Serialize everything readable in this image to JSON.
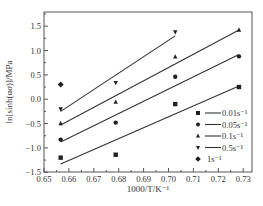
{
  "chart_data": {
    "type": "scatter",
    "title": "",
    "xlabel": "1000/T/K⁻¹",
    "ylabel": "ln[sinh(ασ)]/MPa",
    "xlim": [
      0.65,
      0.735
    ],
    "ylim": [
      -1.5,
      1.75
    ],
    "x_ticks": [
      0.65,
      0.66,
      0.67,
      0.68,
      0.69,
      0.7,
      0.71,
      0.72,
      0.73
    ],
    "x_tick_labels": [
      "0.65",
      "0.66",
      "0.67",
      "0.68",
      "0.69",
      "0.70",
      "0.71",
      "0.72",
      "0.73"
    ],
    "y_ticks": [
      -1.5,
      -1.0,
      -0.5,
      0.0,
      0.5,
      1.0,
      1.5
    ],
    "y_tick_labels": [
      "−1.5",
      "−1.0",
      "−0.5",
      "0.0",
      "0.5",
      "1.0",
      "1.5"
    ],
    "grid": false,
    "legend_position": "lower right",
    "series": [
      {
        "name": "0.01s⁻¹",
        "marker": "square",
        "x": [
          0.6567,
          0.6788,
          0.7027,
          0.7283
        ],
        "y": [
          -1.2,
          -1.14,
          -0.1,
          0.25
        ],
        "fit_line": {
          "x": [
            0.6567,
            0.7283
          ],
          "y": [
            -1.33,
            0.27
          ]
        }
      },
      {
        "name": "0.05s⁻¹",
        "marker": "circle",
        "x": [
          0.6567,
          0.6788,
          0.7027,
          0.7283
        ],
        "y": [
          -0.83,
          -0.48,
          0.46,
          0.88
        ],
        "fit_line": {
          "x": [
            0.6567,
            0.7283
          ],
          "y": [
            -0.88,
            0.92
          ]
        }
      },
      {
        "name": "0.1s⁻¹",
        "marker": "triangle-up",
        "x": [
          0.6567,
          0.6788,
          0.7027,
          0.7283
        ],
        "y": [
          -0.5,
          -0.06,
          0.87,
          1.42
        ],
        "fit_line": {
          "x": [
            0.6567,
            0.7283
          ],
          "y": [
            -0.53,
            1.42
          ]
        }
      },
      {
        "name": "0.5s⁻¹",
        "marker": "triangle-down",
        "x": [
          0.6567,
          0.6788,
          0.7027
        ],
        "y": [
          -0.2,
          0.34,
          1.38
        ],
        "fit_line": {
          "x": [
            0.6567,
            0.7027
          ],
          "y": [
            -0.25,
            1.3
          ]
        }
      },
      {
        "name": "1s⁻¹",
        "marker": "diamond",
        "x": [
          0.6567
        ],
        "y": [
          0.3
        ],
        "fit_line": null
      }
    ]
  }
}
